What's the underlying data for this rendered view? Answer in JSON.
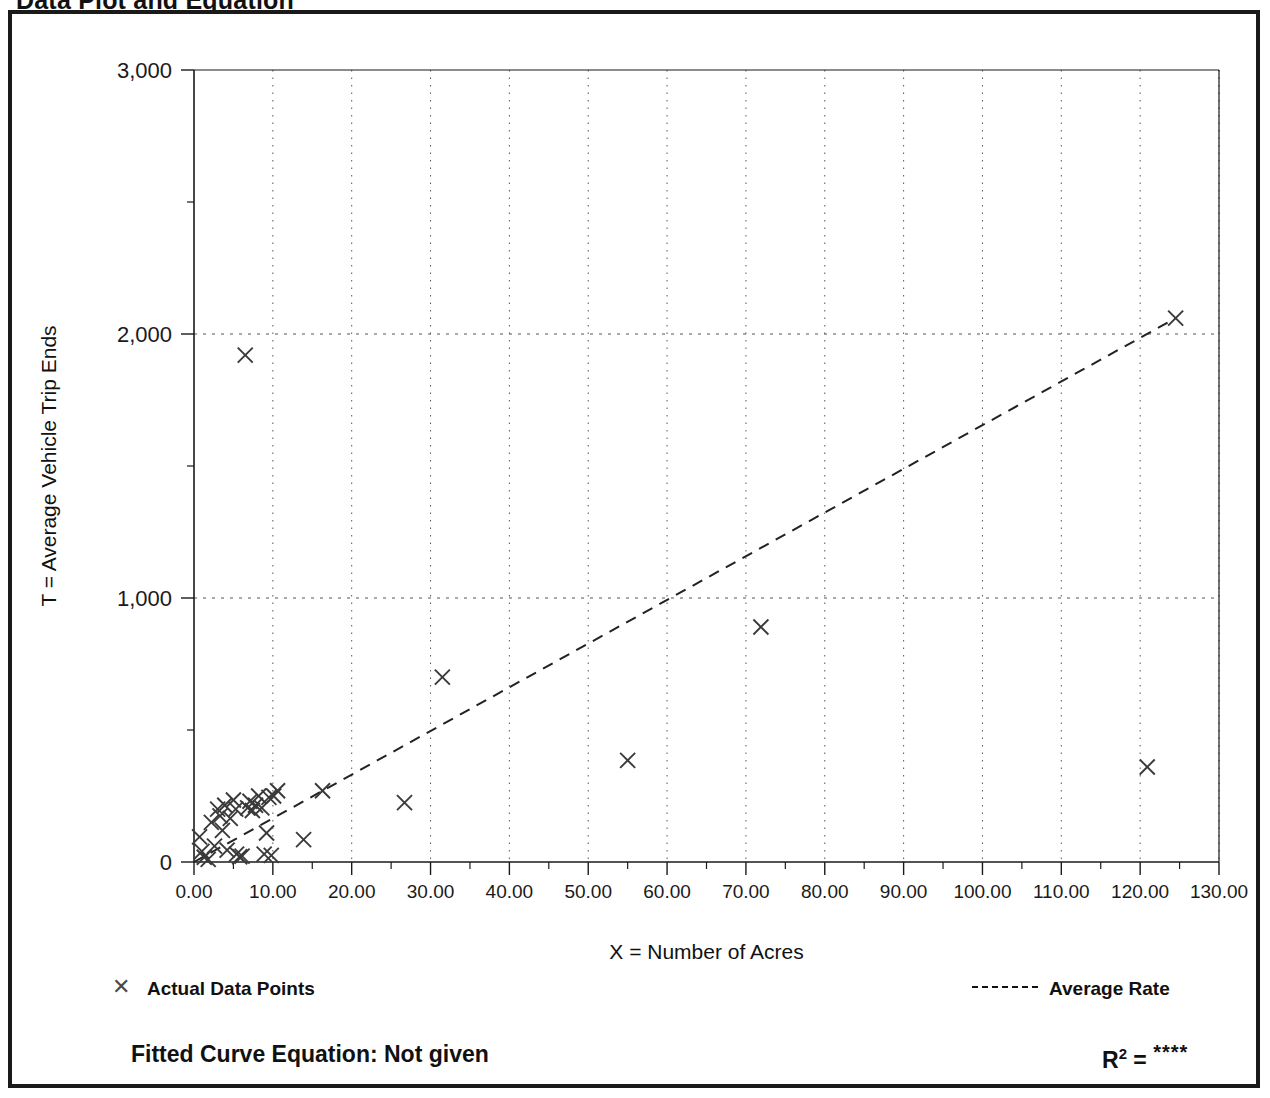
{
  "page": {
    "title": "Data Plot and Equation"
  },
  "chart_data": {
    "type": "scatter",
    "title": "Data Plot and Equation",
    "xlabel": "X = Number of Acres",
    "ylabel": "T = Average Vehicle Trip Ends",
    "xlim": [
      0,
      130
    ],
    "ylim": [
      0,
      3000
    ],
    "xticks": [
      0,
      10,
      20,
      30,
      40,
      50,
      60,
      70,
      80,
      90,
      100,
      110,
      120,
      130
    ],
    "xticklabels": [
      "0.00",
      "10.00",
      "20.00",
      "30.00",
      "40.00",
      "50.00",
      "60.00",
      "70.00",
      "80.00",
      "90.00",
      "100.00",
      "110.00",
      "120.00",
      "130.00"
    ],
    "yticks": [
      0,
      1000,
      2000,
      3000
    ],
    "yticklabels": [
      "0",
      "1,000",
      "2,000",
      "3,000"
    ],
    "yminorticks": [
      500,
      1500,
      2500
    ],
    "grid": true,
    "grid_style": "dotted",
    "legend_position": "below-plot",
    "series": [
      {
        "name": "Actual Data Points",
        "marker": "x",
        "color": "#3a3a3a",
        "points": [
          [
            0.7,
            95
          ],
          [
            1.0,
            40
          ],
          [
            1.3,
            18
          ],
          [
            1.8,
            10
          ],
          [
            2.2,
            150
          ],
          [
            2.6,
            60
          ],
          [
            3.0,
            200
          ],
          [
            3.3,
            175
          ],
          [
            3.6,
            120
          ],
          [
            3.9,
            215
          ],
          [
            4.2,
            45
          ],
          [
            4.6,
            165
          ],
          [
            5.0,
            235
          ],
          [
            5.3,
            200
          ],
          [
            5.4,
            30
          ],
          [
            5.8,
            20
          ],
          [
            6.1,
            22
          ],
          [
            6.5,
            1920
          ],
          [
            6.8,
            205
          ],
          [
            7.1,
            230
          ],
          [
            7.4,
            195
          ],
          [
            7.8,
            215
          ],
          [
            8.2,
            250
          ],
          [
            8.6,
            205
          ],
          [
            8.9,
            30
          ],
          [
            9.2,
            110
          ],
          [
            9.5,
            245
          ],
          [
            9.8,
            25
          ],
          [
            10.1,
            250
          ],
          [
            10.6,
            270
          ],
          [
            13.9,
            85
          ],
          [
            16.3,
            270
          ],
          [
            26.7,
            225
          ],
          [
            31.5,
            700
          ],
          [
            55.0,
            385
          ],
          [
            71.9,
            890
          ],
          [
            120.9,
            360
          ],
          [
            124.5,
            2060
          ]
        ]
      }
    ],
    "trendline": {
      "name": "Average Rate",
      "style": "dashed",
      "color": "#222222",
      "x_start": 0,
      "y_start": 0,
      "x_end": 124.5,
      "y_end": 2060
    }
  },
  "legend": {
    "points_label": "Actual Data Points",
    "points_marker": "✕",
    "rate_label": "Average Rate"
  },
  "footer": {
    "equation_label": "Fitted Curve Equation:  Not given",
    "r2_prefix": "R",
    "r2_exponent": "2",
    "r2_equals": " = ",
    "r2_value": "****"
  }
}
